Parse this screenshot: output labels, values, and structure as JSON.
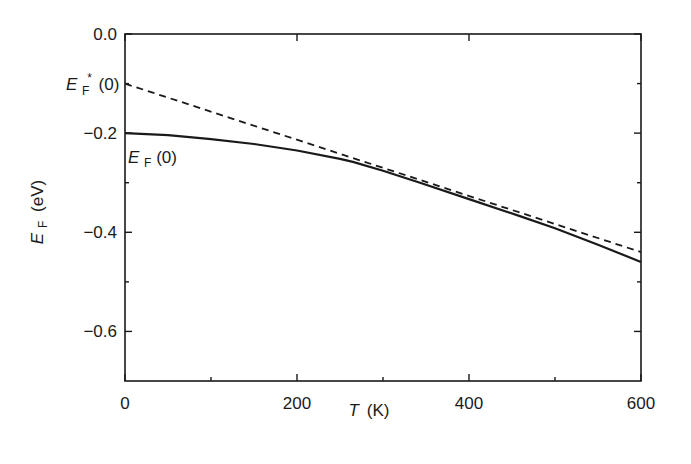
{
  "chart_data": {
    "type": "line",
    "title": "",
    "xlabel": "T (K)",
    "xlabel_symbol": "T",
    "xlabel_unit": "(K)",
    "ylabel": "E_F (eV)",
    "ylabel_symbol": "E",
    "ylabel_sub": "F",
    "ylabel_unit": "(eV)",
    "xlim": [
      0,
      600
    ],
    "ylim": [
      -0.7,
      0.0
    ],
    "x_ticks": [
      0,
      200,
      400,
      600
    ],
    "x_tick_labels": [
      "0",
      "200",
      "400",
      "600"
    ],
    "x_minor_ticks": [
      100,
      300,
      500
    ],
    "y_ticks": [
      0.0,
      -0.2,
      -0.4,
      -0.6
    ],
    "y_tick_labels": [
      "0.0",
      "−0.2",
      "−0.4",
      "−0.6"
    ],
    "y_minor_ticks": [
      -0.1,
      -0.3,
      -0.5
    ],
    "grid": false,
    "legend": "none (inline curve labels)",
    "series": [
      {
        "name": "E_F(T)",
        "style": "solid",
        "x": [
          0,
          50,
          100,
          150,
          200,
          250,
          265,
          300,
          343,
          400,
          460,
          500,
          550,
          600
        ],
        "values": [
          -0.2,
          -0.204,
          -0.212,
          -0.222,
          -0.235,
          -0.252,
          -0.258,
          -0.276,
          -0.3,
          -0.333,
          -0.368,
          -0.392,
          -0.425,
          -0.46
        ]
      },
      {
        "name": "E_F*(T) linear extrapolation",
        "style": "dashed",
        "x": [
          0,
          600
        ],
        "values": [
          -0.1,
          -0.44
        ]
      }
    ],
    "annotations": [
      {
        "text": "E_F*(0)",
        "symbol": "E",
        "sub": "F",
        "sup": "*",
        "tail": "(0)",
        "position": "left of y-axis at -0.10"
      },
      {
        "text": "E_F(0)",
        "symbol": "E",
        "sub": "F",
        "tail": "(0)",
        "position": "inside plot below solid curve at T=0"
      }
    ]
  }
}
